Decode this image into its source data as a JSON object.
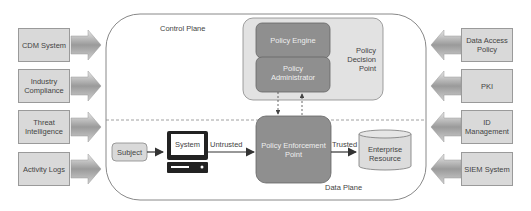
{
  "diagram": {
    "planes": {
      "control": "Control Plane",
      "data": "Data Plane"
    },
    "left_sources": [
      {
        "label": "CDM System"
      },
      {
        "label": "Industry Compliance"
      },
      {
        "label": "Threat Intelligence"
      },
      {
        "label": "Activity Logs"
      }
    ],
    "right_sources": [
      {
        "label": "Data Access Policy"
      },
      {
        "label": "PKI"
      },
      {
        "label": "ID Management"
      },
      {
        "label": "SIEM System"
      }
    ],
    "pdp": {
      "label": "Policy Decision Point",
      "engine": "Policy Engine",
      "administrator": "Policy Administrator"
    },
    "pep": {
      "label": "Policy Enforcement Point"
    },
    "subject": "Subject",
    "system": "System",
    "resource": "Enterprise Resource",
    "edges": {
      "untrusted": "Untrusted",
      "trusted": "Trusted"
    },
    "colors": {
      "source_box": "#d9d9d9",
      "pdp_outer": "#e2e2e2",
      "pdp_inner": "#8f8f8f",
      "pep": "#8f8f8f",
      "resource": "#dcdcdc"
    }
  }
}
